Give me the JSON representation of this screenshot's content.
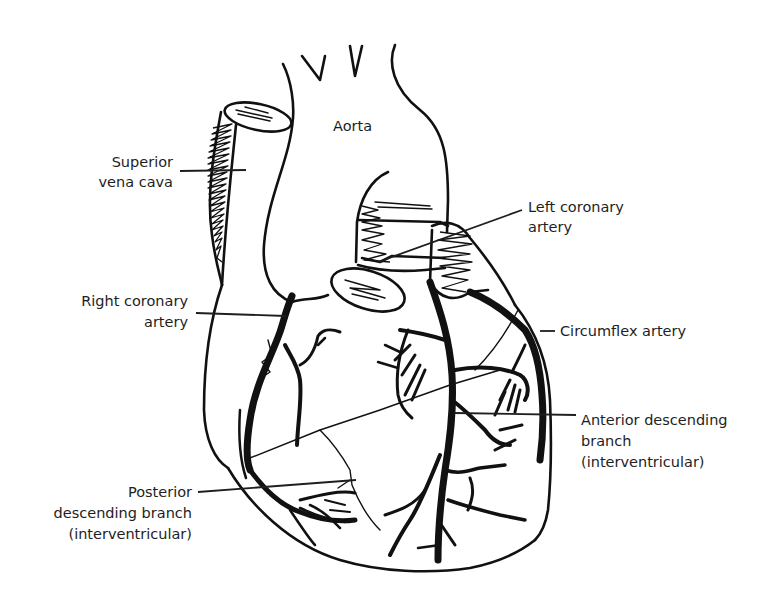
{
  "diagram": {
    "type": "anatomical-illustration",
    "labels": {
      "aorta": [
        "Aorta"
      ],
      "superior_vena_cava": [
        "Superior",
        "vena cava"
      ],
      "left_coronary_artery": [
        "Left coronary",
        "artery"
      ],
      "right_coronary_artery": [
        "Right coronary",
        "artery"
      ],
      "circumflex_artery": [
        "Circumflex artery"
      ],
      "anterior_descending_branch": [
        "Anterior descending",
        "branch",
        "(interventricular)"
      ],
      "posterior_descending_branch": [
        "Posterior",
        "descending branch",
        "(interventricular)"
      ]
    },
    "colors": {
      "ink": "#111111",
      "background": "#ffffff",
      "label_text": "#1e1e1e"
    }
  }
}
